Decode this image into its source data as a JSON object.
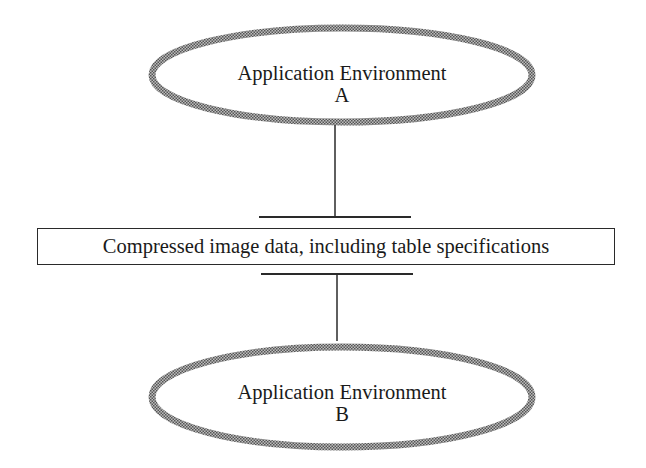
{
  "diagram": {
    "nodes": [
      {
        "id": "env-a",
        "shape": "ellipse",
        "line1": "Application Environment",
        "line2": "A"
      },
      {
        "id": "data",
        "shape": "rectangle",
        "label": "Compressed image data, including table specifications"
      },
      {
        "id": "env-b",
        "shape": "ellipse",
        "line1": "Application Environment",
        "line2": "B"
      }
    ],
    "edges": [
      {
        "from": "env-a",
        "to": "data",
        "style": "line-with-bar"
      },
      {
        "from": "data",
        "to": "env-b",
        "style": "line-with-bar"
      }
    ],
    "colors": {
      "ellipse_border": "#8a8a8a",
      "line": "#2a2a2a",
      "text": "#1a1a1a",
      "background": "#ffffff"
    }
  }
}
